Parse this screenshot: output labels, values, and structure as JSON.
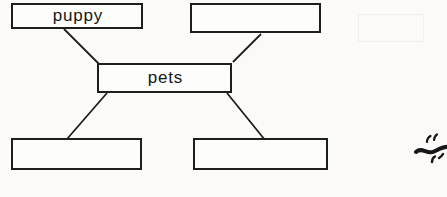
{
  "diagram": {
    "type": "concept-map",
    "center_node": "pets",
    "nodes": [
      {
        "id": "puppy",
        "label": "puppy",
        "filled": true
      },
      {
        "id": "top-right",
        "label": "",
        "filled": false
      },
      {
        "id": "pets",
        "label": "pets",
        "filled": true
      },
      {
        "id": "bottom-left",
        "label": "",
        "filled": false
      },
      {
        "id": "bottom-right",
        "label": "",
        "filled": false
      }
    ],
    "edges": [
      {
        "from": "pets",
        "to": "puppy"
      },
      {
        "from": "pets",
        "to": "top-right"
      },
      {
        "from": "pets",
        "to": "bottom-left"
      },
      {
        "from": "pets",
        "to": "bottom-right"
      }
    ]
  },
  "annotations": {
    "pen_scribble": "small handwritten pen scribble at right edge, partially cut off"
  },
  "colors": {
    "ink": "#1e1e1e",
    "paper": "#fbfaf8",
    "node_fill": "#fdfdfc"
  }
}
